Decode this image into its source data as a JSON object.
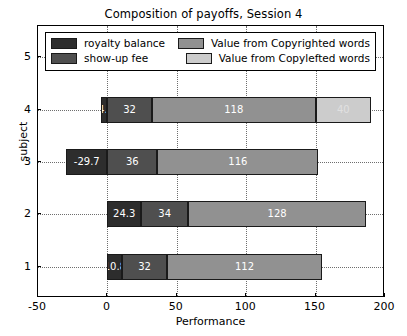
{
  "chart_data": {
    "type": "bar",
    "orientation": "horizontal",
    "stacked": true,
    "title": "Composition of payoffs, Session 4",
    "xlabel": "Performance",
    "ylabel": "subject",
    "categories": [
      "1",
      "2",
      "3",
      "4",
      "5"
    ],
    "xlim": [
      -50,
      200
    ],
    "ylim": [
      0.4,
      5.6
    ],
    "xticks": [
      -50,
      0,
      50,
      100,
      150,
      200
    ],
    "xticklabels": [
      "-50",
      "0",
      "50",
      "100",
      "150",
      "200"
    ],
    "yticks": [
      1,
      2,
      3,
      4,
      5
    ],
    "yticklabels": [
      "1",
      "2",
      "3",
      "4",
      "5"
    ],
    "grid": true,
    "grid_style": "dotted",
    "legend_position": "upper center",
    "series": [
      {
        "name": "royalty balance",
        "color": "#2d2d2d",
        "values": [
          10.8,
          24.3,
          -29.7,
          -4.5,
          8.9
        ],
        "labels": [
          "10.8",
          "24.3",
          "-29.7",
          "-4.5",
          ".9"
        ]
      },
      {
        "name": "show-up fee",
        "color": "#4f4f4f",
        "values": [
          32,
          34,
          36,
          32,
          38
        ],
        "labels": [
          "32",
          "34",
          "36",
          "32",
          "38"
        ]
      },
      {
        "name": "Value from Copyrighted words",
        "color": "#919191",
        "values": [
          112,
          128,
          116,
          118,
          69
        ],
        "labels": [
          "112",
          "128",
          "116",
          "118",
          "69"
        ]
      },
      {
        "name": "Value from Copylefted words",
        "color": "#cccccc",
        "values": [
          0,
          0,
          0,
          40,
          27
        ],
        "labels": [
          "",
          "",
          "",
          "40",
          "27"
        ]
      }
    ]
  },
  "legend": {
    "entries": [
      {
        "label": "royalty balance",
        "color": "#2d2d2d"
      },
      {
        "label": "Value from Copyrighted words",
        "color": "#919191"
      },
      {
        "label": "show-up fee",
        "color": "#4f4f4f"
      },
      {
        "label": "Value from Copylefted words",
        "color": "#cccccc"
      }
    ]
  }
}
